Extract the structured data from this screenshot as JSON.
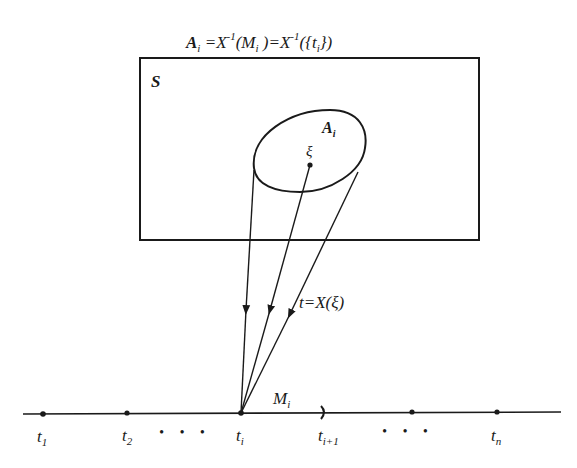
{
  "diagram": {
    "title_formula": {
      "lhs": "A",
      "lhs_sub": "i",
      "eq1": " =X",
      "sup1": "-1",
      "part2": "(M",
      "part2_sub": "i",
      "part3": " )=X",
      "sup2": "-1",
      "part4": "({t",
      "part4_sub": "i",
      "part5": "})"
    },
    "sample_space_label": "S",
    "event_label": "A",
    "event_label_sub": "i",
    "point_label": "ξ",
    "mapping_label": "t=X(ξ)",
    "interval_label": "M",
    "interval_label_sub": "i",
    "axis_points": [
      {
        "label": "t",
        "sub": "1"
      },
      {
        "label": "t",
        "sub": "2"
      },
      {
        "label": "t",
        "sub": "i"
      },
      {
        "label": "t",
        "sub": "i+1"
      },
      {
        "label": "t",
        "sub": "n"
      }
    ],
    "ellipsis": "• • •",
    "colors": {
      "ink": "#1a1a1a",
      "background": "#ffffff"
    }
  }
}
